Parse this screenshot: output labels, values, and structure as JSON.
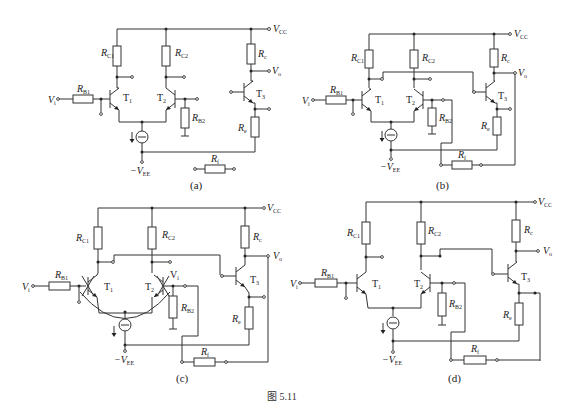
{
  "figure": {
    "caption": "图 5.11",
    "panels": [
      {
        "id": "a",
        "caption": "(a)",
        "labels": {
          "vcc": "V",
          "vcc_sub": "CC",
          "vo": "V",
          "vo_sub": "o",
          "vi": "V",
          "vi_sub": "i",
          "rc1": "R",
          "rc1_sub": "C1",
          "rc2": "R",
          "rc2_sub": "C2",
          "rb1": "R",
          "rb1_sub": "B1",
          "rb2": "R",
          "rb2_sub": "B2",
          "rc": "R",
          "rc_sub": "c",
          "re": "R",
          "re_sub": "e",
          "rf": "R",
          "rf_sub": "f",
          "t1": "T",
          "t1_sub": "1",
          "t2": "T",
          "t2_sub": "2",
          "t3": "T",
          "t3_sub": "3",
          "vee": "−V",
          "vee_sub": "EE"
        }
      },
      {
        "id": "b",
        "caption": "(b)",
        "labels": {
          "vcc": "V",
          "vcc_sub": "CC",
          "vo": "V",
          "vo_sub": "o",
          "vi": "V",
          "vi_sub": "i",
          "rc1": "R",
          "rc1_sub": "C1",
          "rc2": "R",
          "rc2_sub": "C2",
          "rb1": "R",
          "rb1_sub": "B1",
          "rb2": "R",
          "rb2_sub": "B2",
          "rc": "R",
          "rc_sub": "c",
          "re": "R",
          "re_sub": "e",
          "rf": "R",
          "rf_sub": "f",
          "t1": "T",
          "t1_sub": "1",
          "t2": "T",
          "t2_sub": "2",
          "t3": "T",
          "t3_sub": "3",
          "vee": "−V",
          "vee_sub": "EE"
        }
      },
      {
        "id": "c",
        "caption": "(c)",
        "labels": {
          "vcc": "V",
          "vcc_sub": "CC",
          "vo": "V",
          "vo_sub": "o",
          "vi": "V",
          "vi_sub": "i",
          "vi2": "V",
          "vi2_sub": "i",
          "rc1": "R",
          "rc1_sub": "C1",
          "rc2": "R",
          "rc2_sub": "C2",
          "rb1": "R",
          "rb1_sub": "B1",
          "rb2": "R",
          "rb2_sub": "B2",
          "rc": "R",
          "rc_sub": "c",
          "re": "R",
          "re_sub": "e",
          "rf": "R",
          "rf_sub": "f",
          "t1": "T",
          "t1_sub": "1",
          "t2": "T",
          "t2_sub": "2",
          "t3": "T",
          "t3_sub": "3",
          "vee": "−V",
          "vee_sub": "EE"
        }
      },
      {
        "id": "d",
        "caption": "(d)",
        "labels": {
          "vcc": "V",
          "vcc_sub": "CC",
          "vo": "V",
          "vo_sub": "o",
          "vi": "V",
          "vi_sub": "i",
          "rc1": "R",
          "rc1_sub": "C1",
          "rc2": "R",
          "rc2_sub": "C2",
          "rb1": "R",
          "rb1_sub": "B1",
          "rb2": "R",
          "rb2_sub": "B2",
          "rc": "R",
          "rc_sub": "c",
          "re": "R",
          "re_sub": "e",
          "rf": "R",
          "rf_sub": "f",
          "t1": "T",
          "t1_sub": "1",
          "t2": "T",
          "t2_sub": "2",
          "t3": "T",
          "t3_sub": "3",
          "vee": "−V",
          "vee_sub": "EE"
        }
      }
    ]
  },
  "colors": {
    "line": "#333333",
    "background": "#ffffff"
  }
}
